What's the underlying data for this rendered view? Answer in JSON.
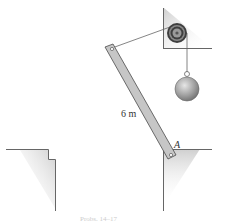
{
  "figure": {
    "labels": {
      "length": "6 m",
      "point_a": "A"
    },
    "caption": "Probs. 14–17"
  },
  "colors": {
    "line": "#555555",
    "bar_fill": "#c8c8c8",
    "shadow": "#d8d8d8",
    "ball": "#999999",
    "pulley": "#444444"
  }
}
